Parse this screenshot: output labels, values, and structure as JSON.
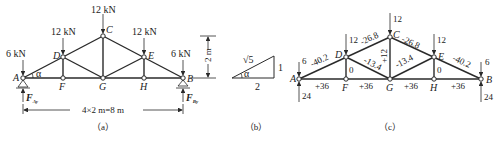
{
  "figure_a": {
    "caption": "（a）",
    "nodes": {
      "A": "A",
      "B": "B",
      "C": "C",
      "D": "D",
      "E": "E",
      "F": "F",
      "G": "G",
      "H": "H"
    },
    "loads": {
      "A": "6 kN",
      "D": "12 kN",
      "C": "12 kN",
      "E": "12 kN",
      "B": "6 kN"
    },
    "angle": "α",
    "reaction_A": "F",
    "reaction_A_sub": "Ay",
    "reaction_B": "F",
    "reaction_B_sub": "By",
    "height_dim": "2 m",
    "span_dim": "4×2 m=8 m"
  },
  "figure_b": {
    "caption": "（b）",
    "hypotenuse": "√5",
    "vertical": "1",
    "horizontal": "2",
    "angle": "α"
  },
  "figure_c": {
    "caption": "（c）",
    "nodes": {
      "A": "A",
      "B": "B",
      "C": "C",
      "D": "D",
      "E": "E",
      "F": "F",
      "G": "G",
      "H": "H"
    },
    "loads": {
      "A": "6",
      "D": "12",
      "C": "12",
      "E": "12",
      "B": "6"
    },
    "reactions": {
      "A": "24",
      "B": "24"
    },
    "member_forces": {
      "AD": "-40.2",
      "DC": "-26.8",
      "CE": "-26.8",
      "EB": "-40.2",
      "DG": "-13.4",
      "GE": "-13.4",
      "CG": "+12",
      "DF": "0",
      "EH": "0",
      "AF": "+36",
      "FG": "+36",
      "GH": "+36",
      "HB": "+36"
    }
  }
}
